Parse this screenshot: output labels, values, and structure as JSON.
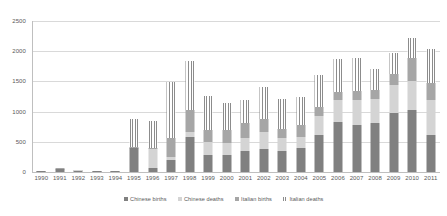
{
  "chart_data": {
    "type": "bar",
    "stacked": true,
    "title": "",
    "subtitle": "",
    "xlabel": "",
    "ylabel": "",
    "ylim": [
      0,
      2500
    ],
    "yticks": [
      0,
      500,
      1000,
      1500,
      2000,
      2500
    ],
    "grid": true,
    "legend_position": "bottom",
    "categories": [
      "1990",
      "1991",
      "1992",
      "1993",
      "1994",
      "1995",
      "1996",
      "1997",
      "1998",
      "1999",
      "2000",
      "2001",
      "2002",
      "2003",
      "2004",
      "2005",
      "2006",
      "2007",
      "2008",
      "2009",
      "2010",
      "2011"
    ],
    "series": [
      {
        "name": "Chinese births",
        "color": "#808080",
        "pattern": "solid",
        "values": [
          10,
          45,
          25,
          12,
          15,
          390,
          70,
          195,
          580,
          280,
          280,
          345,
          380,
          340,
          395,
          605,
          825,
          785,
          805,
          980,
          1035,
          610
        ]
      },
      {
        "name": "Chinese deaths",
        "color": "#d4d4d4",
        "pattern": "solid",
        "values": [
          5,
          10,
          5,
          4,
          5,
          10,
          310,
          60,
          85,
          210,
          200,
          215,
          290,
          230,
          180,
          320,
          375,
          415,
          405,
          460,
          475,
          585
        ]
      },
      {
        "name": "Italian births",
        "color": "#a6a6a6",
        "pattern": "solid",
        "values": [
          3,
          6,
          3,
          3,
          3,
          10,
          10,
          310,
          355,
          200,
          220,
          255,
          210,
          140,
          200,
          160,
          130,
          140,
          150,
          175,
          380,
          285
        ]
      },
      {
        "name": "Italian deaths",
        "color": "#8c8c8c",
        "pattern": "vertical-stripes",
        "values": [
          2,
          4,
          2,
          1,
          2,
          460,
          450,
          925,
          820,
          565,
          435,
          380,
          520,
          500,
          475,
          525,
          540,
          555,
          350,
          360,
          325,
          560
        ]
      }
    ],
    "totals": [
      20,
      65,
      35,
      20,
      25,
      870,
      840,
      1490,
      1840,
      1255,
      1135,
      1195,
      1400,
      1210,
      1250,
      1610,
      1870,
      1895,
      1710,
      1975,
      2215,
      2040
    ]
  },
  "legend": {
    "items": [
      {
        "label": "Chinese births",
        "swatch": "s-chinese-births"
      },
      {
        "label": "Chinese deaths",
        "swatch": "s-chinese-deaths"
      },
      {
        "label": "Italian births",
        "swatch": "s-italian-births"
      },
      {
        "label": "Italian deaths",
        "swatch": "s-italian-deaths"
      }
    ]
  }
}
